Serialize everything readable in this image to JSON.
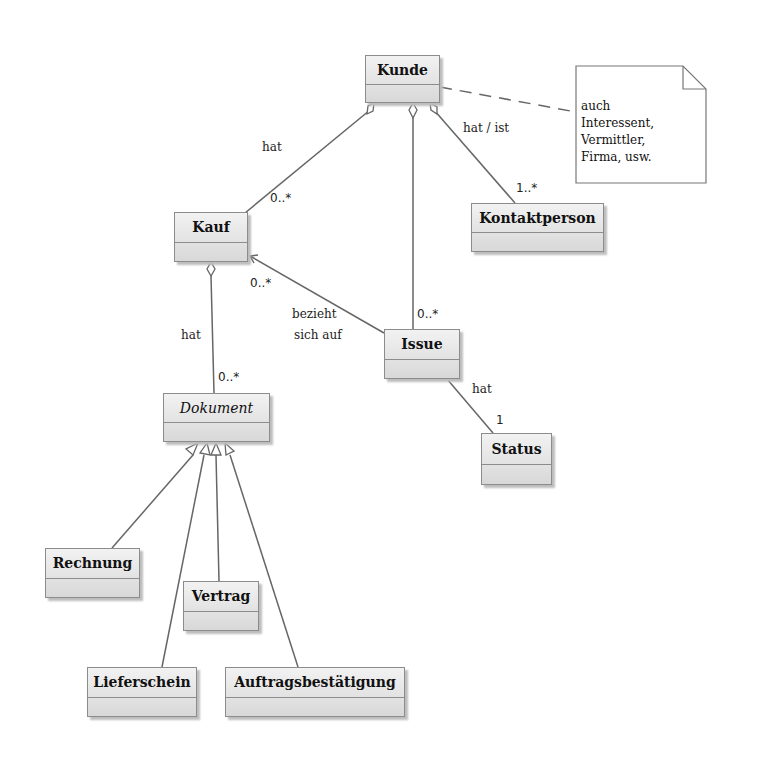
{
  "diagram": {
    "type": "UML class diagram",
    "classes": [
      {
        "id": "kunde",
        "name": "Kunde",
        "abstract": false
      },
      {
        "id": "kauf",
        "name": "Kauf",
        "abstract": false
      },
      {
        "id": "kontaktperson",
        "name": "Kontaktperson",
        "abstract": false
      },
      {
        "id": "issue",
        "name": "Issue",
        "abstract": false
      },
      {
        "id": "status",
        "name": "Status",
        "abstract": false
      },
      {
        "id": "dokument",
        "name": "Dokument",
        "abstract": true
      },
      {
        "id": "rechnung",
        "name": "Rechnung",
        "abstract": false
      },
      {
        "id": "vertrag",
        "name": "Vertrag",
        "abstract": false
      },
      {
        "id": "lieferschein",
        "name": "Lieferschein",
        "abstract": false
      },
      {
        "id": "auftragsbestaetigung",
        "name": "Auftragsbestätigung",
        "abstract": false
      }
    ],
    "note": {
      "lines": [
        "auch",
        "Interessent,",
        "Vermittler,",
        "Firma, usw."
      ],
      "attached_to": "kunde"
    },
    "associations": [
      {
        "from": "kunde",
        "to": "kauf",
        "kind": "aggregation",
        "label": "hat",
        "multiplicity": "0..*"
      },
      {
        "from": "kunde",
        "to": "issue",
        "kind": "aggregation",
        "label": "",
        "multiplicity": "0..*"
      },
      {
        "from": "kunde",
        "to": "kontaktperson",
        "kind": "aggregation",
        "label": "hat / ist",
        "multiplicity": "1..*"
      },
      {
        "from": "issue",
        "to": "kauf",
        "kind": "directed",
        "label": "bezieht sich auf",
        "multiplicity": "0..*"
      },
      {
        "from": "issue",
        "to": "status",
        "kind": "association",
        "label": "hat",
        "multiplicity": "1"
      },
      {
        "from": "kauf",
        "to": "dokument",
        "kind": "aggregation",
        "label": "hat",
        "multiplicity": "0..*"
      }
    ],
    "generalizations": [
      {
        "child": "rechnung",
        "parent": "dokument"
      },
      {
        "child": "lieferschein",
        "parent": "dokument"
      },
      {
        "child": "vertrag",
        "parent": "dokument"
      },
      {
        "child": "auftragsbestaetigung",
        "parent": "dokument"
      }
    ],
    "labels": {
      "kauf_hat": "hat",
      "kauf_mult": "0..*",
      "kontakt_label": "hat / ist",
      "kontakt_mult": "1..*",
      "issue_kunde_mult": "0..*",
      "issue_kauf_mult": "0..*",
      "bezieht1": "bezieht",
      "bezieht2": "sich auf",
      "status_hat": "hat",
      "status_mult": "1",
      "dok_hat": "hat",
      "dok_mult": "0..*"
    }
  }
}
